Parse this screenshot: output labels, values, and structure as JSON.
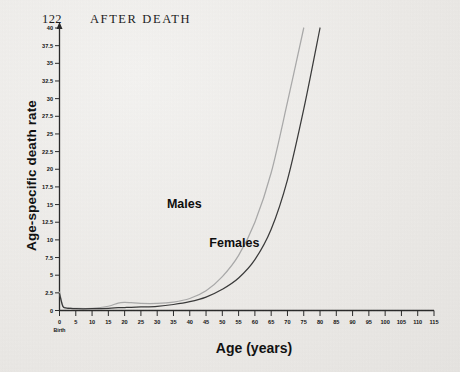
{
  "page": {
    "folio": "122",
    "running_head": "AFTER DEATH",
    "background_color": "#eceae7"
  },
  "chart_data": {
    "type": "line",
    "title": "",
    "xlabel": "Age (years)",
    "ylabel": "Age-specific death rate",
    "xlim": [
      0,
      115
    ],
    "ylim": [
      0,
      40
    ],
    "grid": false,
    "legend": "inline-annotations",
    "x_tick_labels": [
      "0",
      "5",
      "10",
      "15",
      "20",
      "25",
      "30",
      "35",
      "40",
      "45",
      "50",
      "55",
      "60",
      "65",
      "70",
      "75",
      "80",
      "85",
      "90",
      "95",
      "100",
      "105",
      "110",
      "115"
    ],
    "x_origin_sublabel": "Birth",
    "y_tick_labels": [
      "0",
      "2.5",
      "5",
      "7.5",
      "10",
      "12.5",
      "15",
      "17.5",
      "20",
      "22.5",
      "25",
      "27.5",
      "30",
      "32.5",
      "35",
      "37.5",
      "40"
    ],
    "x": [
      0,
      1,
      2,
      3,
      5,
      10,
      15,
      18,
      20,
      22,
      25,
      30,
      35,
      40,
      45,
      50,
      55,
      60,
      65,
      70,
      75,
      80
    ],
    "series": [
      {
        "name": "Males",
        "color": "#a9a9a9",
        "label_text": "Males",
        "label_x": 33,
        "label_y": 14.5,
        "values": [
          2.6,
          0.7,
          0.4,
          0.35,
          0.3,
          0.3,
          0.6,
          1.05,
          1.15,
          1.1,
          1.0,
          1.0,
          1.2,
          1.7,
          2.8,
          4.8,
          7.8,
          12.5,
          19.5,
          29.5,
          41.0,
          null
        ]
      },
      {
        "name": "Females",
        "color": "#3a3a3a",
        "label_text": "Females",
        "label_x": 46,
        "label_y": 9.0,
        "values": [
          2.4,
          0.6,
          0.35,
          0.3,
          0.25,
          0.25,
          0.3,
          0.4,
          0.42,
          0.45,
          0.5,
          0.6,
          0.85,
          1.25,
          1.9,
          3.0,
          4.6,
          7.2,
          11.5,
          18.5,
          28.5,
          41.0
        ]
      }
    ]
  }
}
